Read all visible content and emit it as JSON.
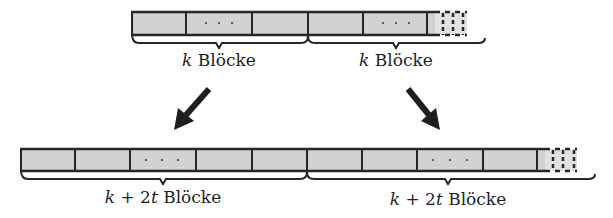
{
  "colors": {
    "block_fill": "#d0d0d0",
    "stroke": "#262626",
    "text": "#1e1e1e"
  },
  "top_row": {
    "groups": [
      {
        "label_var": "k",
        "label_text": "Blöcke"
      },
      {
        "label_var": "k",
        "label_text": "Blöcke"
      }
    ],
    "ellipsis": "· · ·"
  },
  "bottom_row": {
    "groups": [
      {
        "label_var": "k",
        "label_op": "+ 2",
        "label_var2": "t",
        "label_text": "Blöcke"
      },
      {
        "label_var": "k",
        "label_op": "+ 2",
        "label_var2": "t",
        "label_text": "Blöcke"
      }
    ],
    "ellipsis": "· · ·"
  },
  "arrows": [
    {
      "name": "arrow-left-down",
      "direction": "down-left"
    },
    {
      "name": "arrow-right-down",
      "direction": "down-right"
    }
  ]
}
